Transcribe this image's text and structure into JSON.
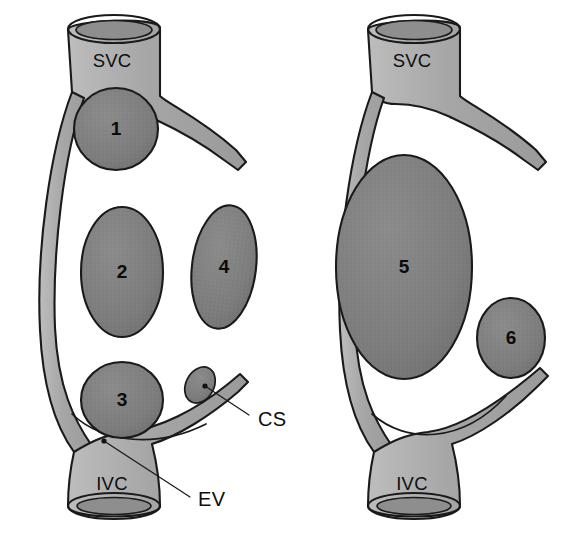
{
  "figure": {
    "width": 568,
    "height": 533,
    "background_color": "#ffffff"
  },
  "colors": {
    "vessel_fill": "#a8a8a8",
    "mass_fill": "#7e7e7e",
    "lumen_fill": "#8e8e8e",
    "outline": "#1a1a1a",
    "text": "#0d0d0d"
  },
  "panels": [
    {
      "id": "left-panel",
      "name": "left-atrial-view",
      "vessels": [
        {
          "id": "svc",
          "label": "SVC",
          "label_x": 112,
          "label_y": 62
        },
        {
          "id": "ivc",
          "label": "IVC",
          "label_x": 112,
          "label_y": 485
        }
      ],
      "masses": [
        {
          "id": "mass-1",
          "label": "1",
          "cx": 116,
          "cy": 129,
          "rx": 42,
          "ry": 41
        },
        {
          "id": "mass-2",
          "label": "2",
          "cx": 122,
          "cy": 272,
          "rx": 41,
          "ry": 65
        },
        {
          "id": "mass-3",
          "label": "3",
          "cx": 122,
          "cy": 400,
          "rx": 41,
          "ry": 38
        },
        {
          "id": "mass-4",
          "label": "4",
          "cx": 224,
          "cy": 267,
          "rx": 32,
          "ry": 62
        }
      ],
      "annotations": [
        {
          "id": "cs-annotation",
          "label": "CS",
          "label_x": 256,
          "label_y": 420,
          "target_x": 205,
          "target_y": 386,
          "description": "coronary sinus ostium"
        },
        {
          "id": "ev-annotation",
          "label": "EV",
          "label_x": 196,
          "label_y": 500,
          "target_x": 104,
          "target_y": 440,
          "description": "eustachian valve"
        }
      ]
    },
    {
      "id": "right-panel",
      "name": "right-atrial-view",
      "vessels": [
        {
          "id": "svc",
          "label": "SVC",
          "label_x": 412,
          "label_y": 62
        },
        {
          "id": "ivc",
          "label": "IVC",
          "label_x": 412,
          "label_y": 485
        }
      ],
      "masses": [
        {
          "id": "mass-5",
          "label": "5",
          "cx": 404,
          "cy": 267,
          "rx": 68,
          "ry": 112
        },
        {
          "id": "mass-6",
          "label": "6",
          "cx": 511,
          "cy": 338,
          "rx": 34,
          "ry": 40
        }
      ],
      "annotations": []
    }
  ],
  "legend_keys": [
    "1",
    "2",
    "3",
    "4",
    "5",
    "6",
    "SVC",
    "IVC",
    "CS",
    "EV"
  ]
}
